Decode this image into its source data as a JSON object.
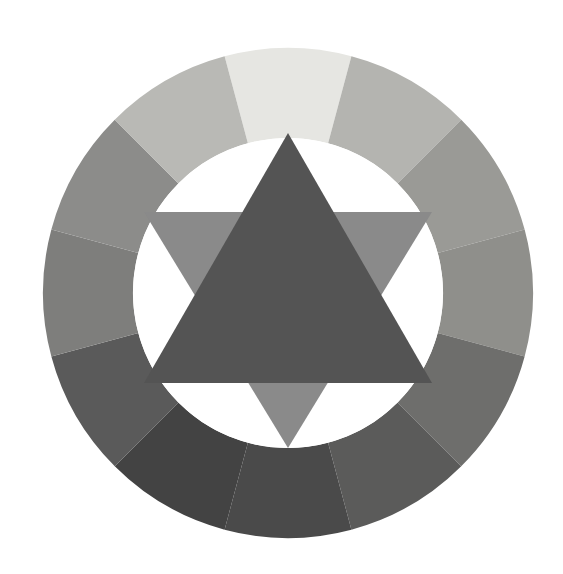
{
  "figure": {
    "name": "itten-color-wheel",
    "background_color": "#ffffff",
    "canvas": {
      "width": 563,
      "height": 574
    }
  },
  "geometry": {
    "center_x": 288,
    "center_y": 293,
    "outer_radius": 245,
    "inner_radius": 155,
    "segment_count": 12,
    "segment_angle_degrees": 30,
    "start_angle_degrees": -105
  },
  "colors": {
    "background": "#ffffff",
    "inner_disc": "#ffffff",
    "primary_triangle": "#545454",
    "secondary_triangle": "#8a8a8a"
  },
  "wheel": {
    "label": "outer-ring",
    "segments": [
      {
        "index": 1,
        "position_oclock": "12",
        "hue_name": "yellow",
        "color": "#e6e6e2",
        "tone": "lightest"
      },
      {
        "index": 2,
        "position_oclock": "1",
        "hue_name": "yellow-orange",
        "color": "#b4b4b0",
        "tone": "light"
      },
      {
        "index": 3,
        "position_oclock": "2",
        "hue_name": "orange",
        "color": "#9a9a96",
        "tone": "light-mid"
      },
      {
        "index": 4,
        "position_oclock": "3",
        "hue_name": "red-orange",
        "color": "#8f8f8b",
        "tone": "mid"
      },
      {
        "index": 5,
        "position_oclock": "4",
        "hue_name": "red",
        "color": "#6e6e6c",
        "tone": "mid-dark"
      },
      {
        "index": 6,
        "position_oclock": "5",
        "hue_name": "red-violet",
        "color": "#5b5b5a",
        "tone": "dark"
      },
      {
        "index": 7,
        "position_oclock": "6",
        "hue_name": "violet",
        "color": "#4a4a4a",
        "tone": "darkest"
      },
      {
        "index": 8,
        "position_oclock": "7",
        "hue_name": "blue-violet",
        "color": "#434343",
        "tone": "darkest"
      },
      {
        "index": 9,
        "position_oclock": "8",
        "hue_name": "blue",
        "color": "#5a5a5a",
        "tone": "dark"
      },
      {
        "index": 10,
        "position_oclock": "9",
        "hue_name": "blue-green",
        "color": "#7e7e7c",
        "tone": "mid-dark"
      },
      {
        "index": 11,
        "position_oclock": "10",
        "hue_name": "green",
        "color": "#8c8c8a",
        "tone": "mid"
      },
      {
        "index": 12,
        "position_oclock": "11",
        "hue_name": "yellow-green",
        "color": "#b9b9b5",
        "tone": "light"
      }
    ]
  },
  "star": {
    "label": "star-of-david",
    "triangles": [
      {
        "name": "primary-triangle-up",
        "orientation": "up",
        "color": "#545454",
        "points": "288,133 432,383 144,383"
      },
      {
        "name": "secondary-triangle-down",
        "orientation": "down",
        "color": "#8a8a8a",
        "points": "288,448 144,212 432,212"
      }
    ]
  },
  "chart_data": {
    "type": "pie",
    "categories": [
      "yellow",
      "yellow-orange",
      "orange",
      "red-orange",
      "red",
      "red-violet",
      "violet",
      "blue-violet",
      "blue",
      "blue-green",
      "green",
      "yellow-green"
    ],
    "values": [
      30,
      30,
      30,
      30,
      30,
      30,
      30,
      30,
      30,
      30,
      30,
      30
    ],
    "value_unit": "degrees",
    "colors": [
      "#e6e6e2",
      "#b4b4b0",
      "#9a9a96",
      "#8f8f8b",
      "#6e6e6c",
      "#5b5b5a",
      "#4a4a4a",
      "#434343",
      "#5a5a5a",
      "#7e7e7c",
      "#8c8c8a",
      "#b9b9b5"
    ],
    "xlabel": "",
    "ylabel": "",
    "legend": false,
    "grid": false,
    "annotations": [
      "Central upward triangle marks the three primary colours",
      "Central downward triangle marks the three secondary colours"
    ]
  }
}
